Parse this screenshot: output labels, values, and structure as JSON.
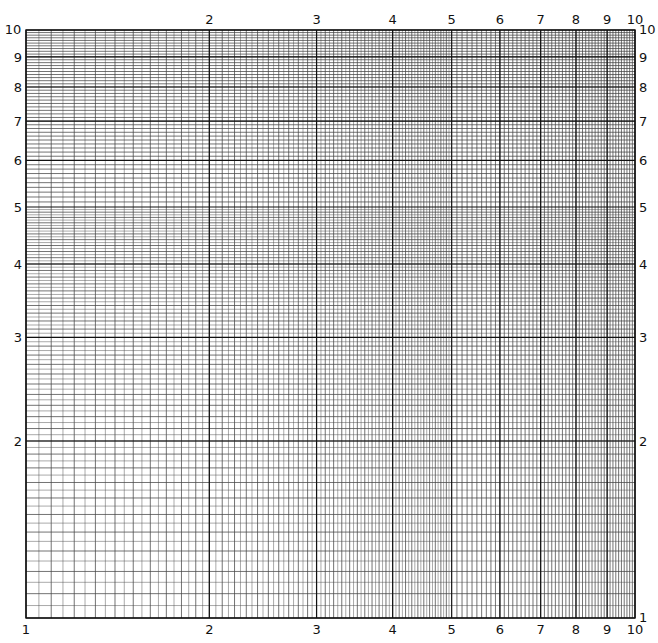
{
  "colors": {
    "major": "#111111",
    "minor": "#555555",
    "background": "#ffffff"
  },
  "plot_box": {
    "left": 26,
    "right": 635,
    "top": 30,
    "bottom": 618
  },
  "axes": {
    "x": {
      "scale": "log",
      "range": [
        1,
        10
      ],
      "top_labels": [
        "2",
        "3",
        "4",
        "5",
        "6",
        "7",
        "8",
        "9",
        "10"
      ],
      "bottom_labels": [
        "1",
        "2",
        "3",
        "4",
        "5",
        "6",
        "7",
        "8",
        "9",
        "10"
      ]
    },
    "y": {
      "scale": "log",
      "range": [
        1,
        10
      ],
      "left_labels": [
        "10",
        "9",
        "8",
        "7",
        "6",
        "5",
        "4",
        "3",
        "2"
      ],
      "right_labels": [
        "10",
        "9",
        "8",
        "7",
        "6",
        "5",
        "4",
        "3",
        "2",
        "1"
      ]
    }
  },
  "grid": {
    "major": [
      1,
      2,
      3,
      4,
      5,
      6,
      7,
      8,
      9,
      10
    ],
    "minor_steps": [
      {
        "from": 1,
        "to": 5,
        "step": 0.05
      },
      {
        "from": 5,
        "to": 10,
        "step": 0.1
      }
    ]
  }
}
